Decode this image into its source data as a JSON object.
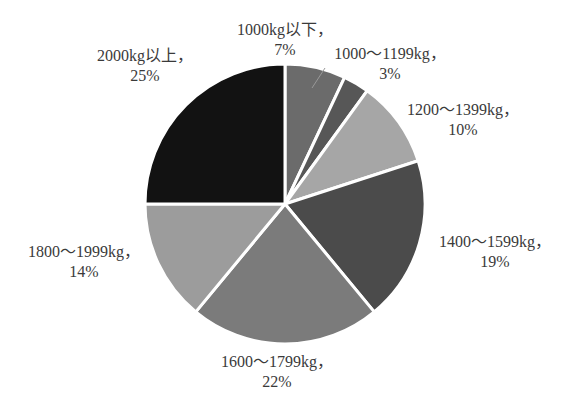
{
  "chart_data": {
    "type": "pie",
    "title": "",
    "start_angle_deg": 0,
    "direction": "clockwise",
    "categories": [
      "1000kg以下",
      "1000～1199kg",
      "1200～1399kg",
      "1400～1599kg",
      "1600～1799kg",
      "1800～1999kg",
      "2000kg以上"
    ],
    "values": [
      7,
      3,
      10,
      19,
      22,
      14,
      25
    ],
    "unit": "%",
    "colors": [
      "#6b6b6b",
      "#575757",
      "#a6a6a6",
      "#4b4b4b",
      "#7b7b7b",
      "#9c9c9c",
      "#121212"
    ],
    "labels": [
      {
        "name": "1000kg以下，",
        "pct": "7%"
      },
      {
        "name": "1000～1199kg，",
        "pct": "3%"
      },
      {
        "name": "1200～1399kg，",
        "pct": "10%"
      },
      {
        "name": "1400～1599kg，",
        "pct": "19%"
      },
      {
        "name": "1600～1799kg，",
        "pct": "22%"
      },
      {
        "name": "1800～1999kg，",
        "pct": "14%"
      },
      {
        "name": "2000kg以上，",
        "pct": "25%"
      }
    ],
    "legend": "none (data labels outside slices)"
  }
}
